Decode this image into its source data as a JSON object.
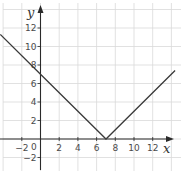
{
  "chart_data": {
    "type": "line",
    "title": "",
    "xlabel": "x",
    "ylabel": "y",
    "xlim": [
      -4.3,
      14.8
    ],
    "ylim": [
      -3.2,
      14.4
    ],
    "grid": true,
    "grid_step": 2,
    "x_ticks": [
      -2,
      2,
      4,
      6,
      8,
      10,
      12
    ],
    "y_ticks": [
      -2,
      2,
      4,
      6,
      8,
      10,
      12
    ],
    "origin_label": "0",
    "series": [
      {
        "name": "y = |x - 7|",
        "x": [
          -4.3,
          0,
          7,
          14.4
        ],
        "y": [
          11.3,
          7,
          0,
          7.4
        ]
      }
    ]
  },
  "labels": {
    "x_axis": "x",
    "y_axis": "y",
    "origin": "0"
  },
  "colors": {
    "grid": "#d9d9d9",
    "axis": "#2a2a2a",
    "line": "#3a3a3a",
    "text": "#4a4a4a"
  }
}
